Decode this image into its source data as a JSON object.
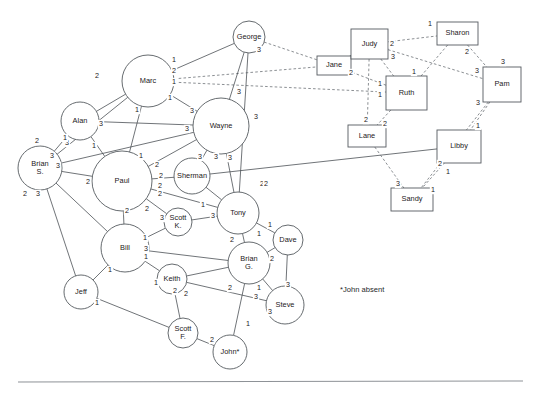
{
  "figure": {
    "footnote": "*John absent",
    "footnote_x": 340,
    "footnote_y": 292,
    "background": "#ffffff",
    "node_stroke": "#555a5f",
    "edge_solid_color": "#4b5055",
    "edge_dashed_color": "#6d7277",
    "rule": {
      "x1": 18,
      "y1": 382,
      "x2": 523,
      "y2": 381
    }
  },
  "nodes": [
    {
      "id": "george",
      "label": "George",
      "shape": "circle",
      "cx": 249,
      "cy": 37,
      "r": 16
    },
    {
      "id": "marc",
      "label": "Marc",
      "shape": "circle",
      "cx": 148,
      "cy": 81,
      "r": 26
    },
    {
      "id": "alan",
      "label": "Alan",
      "shape": "circle",
      "cx": 80,
      "cy": 121,
      "r": 19
    },
    {
      "id": "wayne",
      "label": "Wayne",
      "shape": "circle",
      "cx": 221,
      "cy": 126,
      "r": 28
    },
    {
      "id": "brian_s",
      "label": "Brian S.",
      "label_lines": [
        "Brian",
        "S."
      ],
      "shape": "circle",
      "cx": 40,
      "cy": 168,
      "r": 22
    },
    {
      "id": "paul",
      "label": "Paul",
      "shape": "circle",
      "cx": 122,
      "cy": 181,
      "r": 30
    },
    {
      "id": "sherman",
      "label": "Sherman",
      "shape": "circle",
      "cx": 192,
      "cy": 176,
      "r": 18
    },
    {
      "id": "tony",
      "label": "Tony",
      "shape": "circle",
      "cx": 238,
      "cy": 213,
      "r": 21
    },
    {
      "id": "scott_k",
      "label": "Scott K.",
      "label_lines": [
        "Scott",
        "K."
      ],
      "shape": "circle",
      "cx": 178,
      "cy": 222,
      "r": 14
    },
    {
      "id": "bill",
      "label": "Bill",
      "shape": "circle",
      "cx": 125,
      "cy": 248,
      "r": 24
    },
    {
      "id": "dave",
      "label": "Dave",
      "shape": "circle",
      "cx": 288,
      "cy": 240,
      "r": 15
    },
    {
      "id": "brian_g",
      "label": "Brian G.",
      "label_lines": [
        "Brian",
        "G."
      ],
      "shape": "circle",
      "cx": 249,
      "cy": 263,
      "r": 21
    },
    {
      "id": "keith",
      "label": "Keith",
      "shape": "circle",
      "cx": 172,
      "cy": 279,
      "r": 15
    },
    {
      "id": "jeff",
      "label": "Jeff",
      "shape": "circle",
      "cx": 81,
      "cy": 292,
      "r": 17
    },
    {
      "id": "steve",
      "label": "Steve",
      "shape": "circle",
      "cx": 285,
      "cy": 305,
      "r": 19
    },
    {
      "id": "scott_f",
      "label": "Scott F.",
      "label_lines": [
        "Scott",
        "F."
      ],
      "shape": "circle",
      "cx": 183,
      "cy": 333,
      "r": 15
    },
    {
      "id": "john",
      "label": "John*",
      "shape": "circle",
      "cx": 230,
      "cy": 352,
      "r": 17
    },
    {
      "id": "jane",
      "label": "Jane",
      "shape": "rect",
      "x": 317,
      "y": 56,
      "w": 34,
      "h": 19
    },
    {
      "id": "judy",
      "label": "Judy",
      "shape": "rect",
      "x": 351,
      "y": 29,
      "w": 37,
      "h": 30
    },
    {
      "id": "sharon",
      "label": "Sharon",
      "shape": "rect",
      "x": 437,
      "y": 22,
      "w": 41,
      "h": 23
    },
    {
      "id": "ruth",
      "label": "Ruth",
      "shape": "rect",
      "x": 386,
      "y": 76,
      "w": 41,
      "h": 34
    },
    {
      "id": "pam",
      "label": "Pam",
      "shape": "rect",
      "x": 483,
      "y": 67,
      "w": 38,
      "h": 35
    },
    {
      "id": "lane",
      "label": "Lane",
      "shape": "rect",
      "x": 348,
      "y": 125,
      "w": 38,
      "h": 22
    },
    {
      "id": "libby",
      "label": "Libby",
      "shape": "rect",
      "x": 437,
      "y": 130,
      "w": 44,
      "h": 33
    },
    {
      "id": "sandy",
      "label": "Sandy",
      "shape": "rect",
      "x": 391,
      "y": 188,
      "w": 42,
      "h": 23
    }
  ],
  "edges": [
    {
      "source": "marc",
      "target": "george",
      "style": "solid",
      "weights": [
        {
          "v": "1",
          "x": 174,
          "y": 60
        }
      ]
    },
    {
      "source": "marc",
      "target": "jane",
      "style": "dashed",
      "weights": [
        {
          "v": "2",
          "x": 174,
          "y": 71
        }
      ]
    },
    {
      "source": "marc",
      "target": "ruth",
      "style": "dashed",
      "weights": [
        {
          "v": "1",
          "x": 174,
          "y": 82
        }
      ]
    },
    {
      "source": "marc",
      "target": "wayne",
      "style": "solid",
      "weights": [
        {
          "v": "1",
          "x": 170,
          "y": 98
        },
        {
          "v": "3",
          "x": 192,
          "y": 111
        }
      ]
    },
    {
      "source": "marc",
      "target": "alan",
      "style": "solid",
      "weights": [
        {
          "v": "2",
          "x": 97,
          "y": 76
        }
      ]
    },
    {
      "source": "marc",
      "target": "paul",
      "style": "solid",
      "weights": [
        {
          "v": "1",
          "x": 137,
          "y": 110
        },
        {
          "v": "1",
          "x": 141,
          "y": 156
        }
      ]
    },
    {
      "source": "marc",
      "target": "brian_s",
      "style": "solid",
      "weights": [
        {
          "v": "3",
          "x": 67,
          "y": 143
        }
      ]
    },
    {
      "source": "george",
      "target": "wayne",
      "style": "solid",
      "weights": [
        {
          "v": "3",
          "x": 239,
          "y": 92
        }
      ]
    },
    {
      "source": "george",
      "target": "jane",
      "style": "dashed",
      "weights": [
        {
          "v": "3",
          "x": 259,
          "y": 50
        }
      ]
    },
    {
      "source": "george",
      "target": "tony",
      "style": "solid",
      "weights": [
        {
          "v": "3",
          "x": 256,
          "y": 117
        },
        {
          "v": "2",
          "x": 262,
          "y": 184
        }
      ]
    },
    {
      "source": "alan",
      "target": "wayne",
      "style": "solid",
      "weights": [
        {
          "v": "3",
          "x": 101,
          "y": 124
        }
      ]
    },
    {
      "source": "alan",
      "target": "brian_s",
      "style": "solid",
      "weights": [
        {
          "v": "2",
          "x": 37,
          "y": 141
        },
        {
          "v": "1",
          "x": 65,
          "y": 138
        }
      ]
    },
    {
      "source": "alan",
      "target": "paul",
      "style": "solid",
      "weights": [
        {
          "v": "1",
          "x": 94,
          "y": 146
        }
      ]
    },
    {
      "source": "wayne",
      "target": "paul",
      "style": "solid",
      "weights": [
        {
          "v": "3",
          "x": 187,
          "y": 129
        },
        {
          "v": "2",
          "x": 157,
          "y": 165
        }
      ]
    },
    {
      "source": "wayne",
      "target": "brian_s",
      "style": "solid",
      "weights": [
        {
          "v": "3",
          "x": 52,
          "y": 156
        }
      ]
    },
    {
      "source": "wayne",
      "target": "sherman",
      "style": "solid",
      "weights": [
        {
          "v": "3",
          "x": 200,
          "y": 157
        }
      ]
    },
    {
      "source": "wayne",
      "target": "tony",
      "style": "solid",
      "weights": [
        {
          "v": "3",
          "x": 216,
          "y": 157
        },
        {
          "v": "3",
          "x": 230,
          "y": 158
        }
      ]
    },
    {
      "source": "paul",
      "target": "brian_s",
      "style": "solid",
      "weights": [
        {
          "v": "3",
          "x": 58,
          "y": 166
        },
        {
          "v": "2",
          "x": 88,
          "y": 182
        }
      ]
    },
    {
      "source": "paul",
      "target": "sherman",
      "style": "solid",
      "weights": [
        {
          "v": "2",
          "x": 161,
          "y": 176
        },
        {
          "v": "2",
          "x": 160,
          "y": 186
        }
      ]
    },
    {
      "source": "paul",
      "target": "tony",
      "style": "solid",
      "weights": [
        {
          "v": "2",
          "x": 160,
          "y": 194
        }
      ]
    },
    {
      "source": "paul",
      "target": "bill",
      "style": "solid",
      "weights": [
        {
          "v": "2",
          "x": 127,
          "y": 211
        }
      ]
    },
    {
      "source": "paul",
      "target": "scott_k",
      "style": "solid",
      "weights": [
        {
          "v": "2",
          "x": 147,
          "y": 209
        },
        {
          "v": "3",
          "x": 162,
          "y": 218
        }
      ]
    },
    {
      "source": "brian_s",
      "target": "jeff",
      "style": "solid",
      "weights": [
        {
          "v": "2",
          "x": 25,
          "y": 194
        }
      ]
    },
    {
      "source": "brian_s",
      "target": "bill",
      "style": "solid",
      "weights": [
        {
          "v": "3",
          "x": 38,
          "y": 194
        }
      ]
    },
    {
      "source": "sherman",
      "target": "tony",
      "style": "solid",
      "weights": [
        {
          "v": "1",
          "x": 203,
          "y": 205
        }
      ]
    },
    {
      "source": "sherman",
      "target": "libby",
      "style": "solid",
      "weights": [
        {
          "v": "2",
          "x": 266,
          "y": 184
        }
      ]
    },
    {
      "source": "tony",
      "target": "scott_k",
      "style": "solid",
      "weights": [
        {
          "v": "3",
          "x": 213,
          "y": 216
        }
      ]
    },
    {
      "source": "tony",
      "target": "brian_g",
      "style": "solid",
      "weights": [
        {
          "v": "2",
          "x": 232,
          "y": 240
        }
      ]
    },
    {
      "source": "tony",
      "target": "dave",
      "style": "solid",
      "weights": [
        {
          "v": "1",
          "x": 270,
          "y": 225
        },
        {
          "v": "1",
          "x": 259,
          "y": 234
        }
      ]
    },
    {
      "source": "scott_k",
      "target": "bill",
      "style": "solid",
      "weights": [
        {
          "v": "1",
          "x": 145,
          "y": 238
        },
        {
          "v": "3",
          "x": 146,
          "y": 249
        }
      ]
    },
    {
      "source": "bill",
      "target": "jeff",
      "style": "solid",
      "weights": [
        {
          "v": "1",
          "x": 110,
          "y": 270
        }
      ]
    },
    {
      "source": "bill",
      "target": "keith",
      "style": "solid",
      "weights": [
        {
          "v": "1",
          "x": 156,
          "y": 283
        }
      ]
    },
    {
      "source": "bill",
      "target": "brian_g",
      "style": "solid",
      "weights": [
        {
          "v": "1",
          "x": 146,
          "y": 257
        }
      ]
    },
    {
      "source": "brian_g",
      "target": "dave",
      "style": "solid",
      "weights": [
        {
          "v": "2",
          "x": 272,
          "y": 259
        }
      ]
    },
    {
      "source": "brian_g",
      "target": "steve",
      "style": "solid",
      "weights": [
        {
          "v": "1",
          "x": 259,
          "y": 288
        },
        {
          "v": "3",
          "x": 256,
          "y": 297
        }
      ]
    },
    {
      "source": "brian_g",
      "target": "john",
      "style": "solid",
      "weights": [
        {
          "v": "1",
          "x": 248,
          "y": 324
        }
      ]
    },
    {
      "source": "brian_g",
      "target": "keith",
      "style": "solid",
      "weights": [
        {
          "v": "2",
          "x": 175,
          "y": 291
        },
        {
          "v": "2",
          "x": 230,
          "y": 288
        }
      ]
    },
    {
      "source": "dave",
      "target": "steve",
      "style": "solid",
      "weights": [
        {
          "v": "3",
          "x": 288,
          "y": 285
        }
      ]
    },
    {
      "source": "keith",
      "target": "scott_f",
      "style": "solid",
      "weights": [
        {
          "v": "2",
          "x": 186,
          "y": 294
        }
      ]
    },
    {
      "source": "jeff",
      "target": "scott_f",
      "style": "solid",
      "weights": [
        {
          "v": "1",
          "x": 97,
          "y": 303
        }
      ]
    },
    {
      "source": "john",
      "target": "scott_f",
      "style": "solid",
      "weights": [
        {
          "v": "2",
          "x": 212,
          "y": 340
        }
      ]
    },
    {
      "source": "steve",
      "target": "keith",
      "style": "solid",
      "weights": [
        {
          "v": "3",
          "x": 270,
          "y": 312
        }
      ]
    },
    {
      "source": "judy",
      "target": "sharon",
      "style": "dashed",
      "weights": [
        {
          "v": "1",
          "x": 430,
          "y": 24
        },
        {
          "v": "2",
          "x": 392,
          "y": 44
        }
      ]
    },
    {
      "source": "judy",
      "target": "pam",
      "style": "dashed",
      "weights": [
        {
          "v": "3",
          "x": 393,
          "y": 57
        },
        {
          "v": "3",
          "x": 477,
          "y": 71
        }
      ]
    },
    {
      "source": "judy",
      "target": "ruth",
      "style": "dashed",
      "weights": [
        {
          "v": "1",
          "x": 380,
          "y": 84
        }
      ]
    },
    {
      "source": "judy",
      "target": "lane",
      "style": "dashed",
      "weights": [
        {
          "v": "2",
          "x": 366,
          "y": 120
        }
      ]
    },
    {
      "source": "judy",
      "target": "jane",
      "style": "dashed",
      "weights": [
        {
          "v": "2",
          "x": 351,
          "y": 73
        }
      ]
    },
    {
      "source": "sharon",
      "target": "ruth",
      "style": "dashed",
      "weights": [
        {
          "v": "1",
          "x": 414,
          "y": 72
        }
      ]
    },
    {
      "source": "sharon",
      "target": "pam",
      "style": "dashed",
      "weights": [
        {
          "v": "2",
          "x": 467,
          "y": 52
        },
        {
          "v": "3",
          "x": 503,
          "y": 62
        }
      ]
    },
    {
      "source": "ruth",
      "target": "lane",
      "style": "dashed",
      "weights": [
        {
          "v": "2",
          "x": 385,
          "y": 124
        }
      ]
    },
    {
      "source": "ruth",
      "target": "jane",
      "style": "dashed",
      "weights": [
        {
          "v": "1",
          "x": 380,
          "y": 95
        }
      ]
    },
    {
      "source": "pam",
      "target": "libby",
      "style": "dashed",
      "weights": [
        {
          "v": "3",
          "x": 478,
          "y": 103
        },
        {
          "v": "1",
          "x": 478,
          "y": 126
        }
      ]
    },
    {
      "source": "pam",
      "target": "sandy",
      "style": "dashed",
      "weights": [
        {
          "v": "1",
          "x": 433,
          "y": 190
        }
      ]
    },
    {
      "source": "libby",
      "target": "sandy",
      "style": "dashed",
      "weights": [
        {
          "v": "2",
          "x": 440,
          "y": 164
        },
        {
          "v": "1",
          "x": 448,
          "y": 172
        },
        {
          "v": "3",
          "x": 398,
          "y": 184
        }
      ]
    },
    {
      "source": "lane",
      "target": "sandy",
      "style": "dashed",
      "weights": []
    }
  ]
}
